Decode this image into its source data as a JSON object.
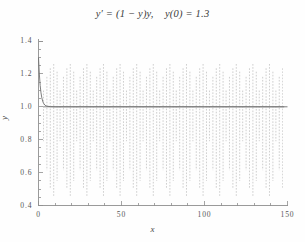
{
  "chart_data": {
    "type": "line",
    "title": "y′ = (1 − y)y,    y(0) = 1.3",
    "xlabel": "x",
    "ylabel": "y",
    "xlim": [
      0,
      150
    ],
    "ylim": [
      0.4,
      1.4
    ],
    "xticks": [
      0,
      50,
      100,
      150
    ],
    "xtick_labels": [
      "0",
      "50",
      "100",
      "150"
    ],
    "x_minor_tick_step": 10,
    "yticks": [
      0.4,
      0.6,
      0.8,
      1.0,
      1.2,
      1.4
    ],
    "ytick_labels": [
      "0.4",
      "0.6",
      "0.8",
      "1.0",
      "1.2",
      "1.4"
    ],
    "y_minor_tick_step": 0.05,
    "grid": false,
    "legend": null,
    "line_color": "#8a8a8a",
    "axis_color": "#8f8f8f",
    "background_color": "#fefefe",
    "series": [
      {
        "name": "numerical solution (unstable)",
        "style": "dashed",
        "color": "#9a9a9a",
        "description": "Euler-type numerical solution that blows up into a period-doubled oscillation; after the initial transient the computed values alternate between an upper branch near 1.26 and a lower branch near 0.45 at every step, drawn as near-vertical dashed spikes spaced about 10 units of x apart, continuing across the whole interval 0 to 148.",
        "oscillation": {
          "start_x": 3,
          "end_x": 148,
          "spike_spacing_x": 2.1,
          "upper_envelope": 1.26,
          "lower_envelope": 0.45
        }
      },
      {
        "name": "exact solution",
        "style": "solid",
        "color": "#6f6f6f",
        "description": "Logistic curve starting at y(0) = 1.3, decaying monotonically to the stable equilibrium y = 1 within roughly the first 5 units of x, then flat at 1.0 for the remainder.",
        "x": [
          0,
          0.5,
          1,
          1.5,
          2,
          2.5,
          3,
          4,
          5,
          7,
          10,
          20,
          40,
          60,
          80,
          100,
          120,
          140,
          150
        ],
        "y": [
          1.3,
          1.2,
          1.13,
          1.085,
          1.055,
          1.035,
          1.022,
          1.009,
          1.004,
          1.001,
          1.0,
          1.0,
          1.0,
          1.0,
          1.0,
          1.0,
          1.0,
          1.0,
          1.0
        ]
      }
    ]
  }
}
